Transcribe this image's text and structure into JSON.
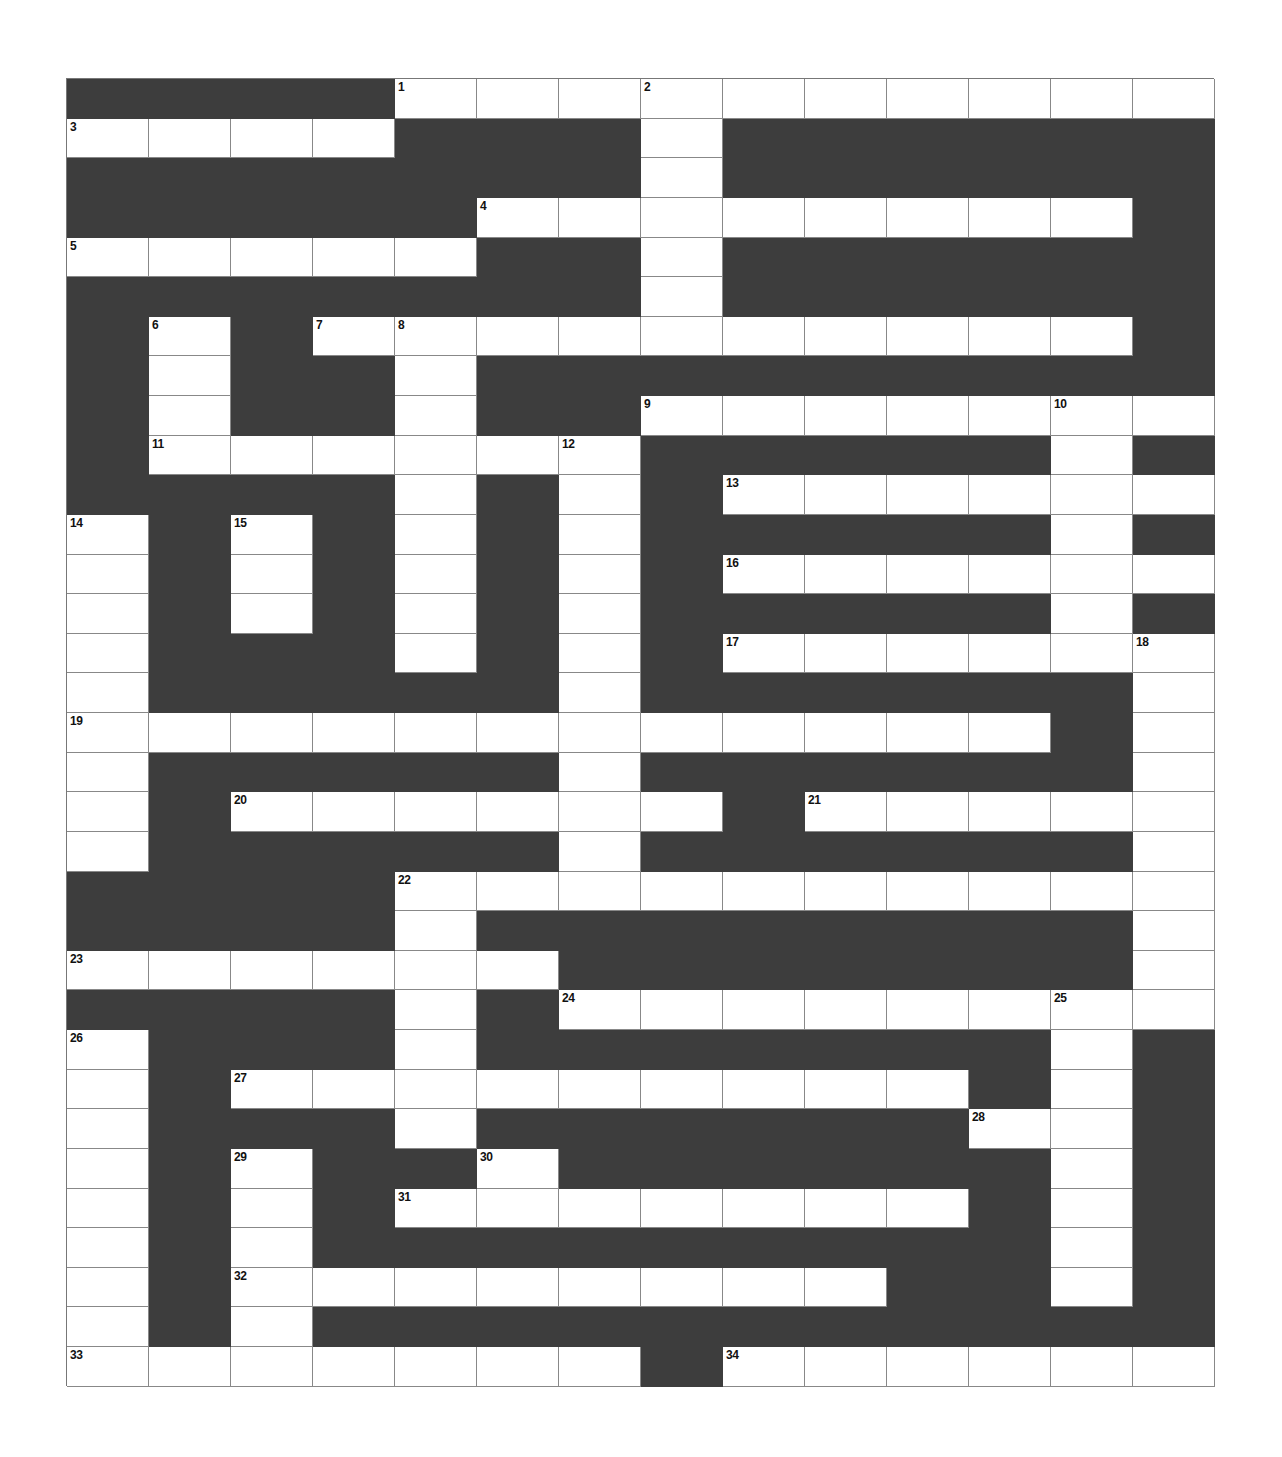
{
  "puzzle": {
    "type": "crossword",
    "columns": 14,
    "rows": 33,
    "colors": {
      "block": "#3d3d3d",
      "cell": "#ffffff",
      "line": "#888888"
    },
    "white_cells": [
      [
        4,
        5,
        6,
        7,
        8,
        9,
        10,
        11,
        12,
        13
      ],
      [
        0,
        1,
        2,
        3,
        7
      ],
      [
        7
      ],
      [
        5,
        6,
        7,
        8,
        9,
        10,
        11,
        12
      ],
      [
        0,
        1,
        2,
        3,
        4,
        7
      ],
      [
        7
      ],
      [
        1,
        3,
        4,
        5,
        6,
        7,
        8,
        9,
        10,
        11,
        12
      ],
      [
        1,
        4
      ],
      [
        1,
        4,
        7,
        8,
        9,
        10,
        11,
        12,
        13
      ],
      [
        1,
        2,
        3,
        4,
        5,
        6,
        12
      ],
      [
        4,
        6,
        8,
        9,
        10,
        11,
        12,
        13
      ],
      [
        0,
        2,
        4,
        6,
        12
      ],
      [
        0,
        2,
        4,
        6,
        8,
        9,
        10,
        11,
        12,
        13
      ],
      [
        0,
        2,
        4,
        6,
        12
      ],
      [
        0,
        4,
        6,
        8,
        9,
        10,
        11,
        12,
        13
      ],
      [
        0,
        6,
        13
      ],
      [
        0,
        1,
        2,
        3,
        4,
        5,
        6,
        7,
        8,
        9,
        10,
        11,
        13
      ],
      [
        0,
        6,
        13
      ],
      [
        0,
        2,
        3,
        4,
        5,
        6,
        7,
        9,
        10,
        11,
        12,
        13
      ],
      [
        0,
        6,
        13
      ],
      [
        4,
        5,
        6,
        7,
        8,
        9,
        10,
        11,
        12,
        13
      ],
      [
        4,
        13
      ],
      [
        0,
        1,
        2,
        3,
        4,
        5,
        13
      ],
      [
        4,
        6,
        7,
        8,
        9,
        10,
        11,
        12,
        13
      ],
      [
        0,
        4,
        12
      ],
      [
        0,
        2,
        3,
        4,
        5,
        6,
        7,
        8,
        9,
        10,
        12
      ],
      [
        0,
        4,
        11,
        12
      ],
      [
        0,
        2,
        5,
        12
      ],
      [
        0,
        2,
        4,
        5,
        6,
        7,
        8,
        9,
        10,
        12
      ],
      [
        0,
        2,
        12
      ],
      [
        0,
        2,
        3,
        4,
        5,
        6,
        7,
        8,
        9,
        12
      ],
      [
        0,
        2
      ],
      [
        0,
        1,
        2,
        3,
        4,
        5,
        6,
        8,
        9,
        10,
        11,
        12,
        13
      ]
    ],
    "numbers": [
      {
        "n": "1",
        "r": 0,
        "c": 4
      },
      {
        "n": "2",
        "r": 0,
        "c": 7
      },
      {
        "n": "3",
        "r": 1,
        "c": 0
      },
      {
        "n": "4",
        "r": 3,
        "c": 5
      },
      {
        "n": "5",
        "r": 4,
        "c": 0
      },
      {
        "n": "6",
        "r": 6,
        "c": 1
      },
      {
        "n": "7",
        "r": 6,
        "c": 3
      },
      {
        "n": "8",
        "r": 6,
        "c": 4
      },
      {
        "n": "9",
        "r": 8,
        "c": 7
      },
      {
        "n": "10",
        "r": 8,
        "c": 12
      },
      {
        "n": "11",
        "r": 9,
        "c": 1
      },
      {
        "n": "12",
        "r": 9,
        "c": 6
      },
      {
        "n": "13",
        "r": 10,
        "c": 8
      },
      {
        "n": "14",
        "r": 11,
        "c": 0
      },
      {
        "n": "15",
        "r": 11,
        "c": 2
      },
      {
        "n": "16",
        "r": 12,
        "c": 8
      },
      {
        "n": "17",
        "r": 14,
        "c": 8
      },
      {
        "n": "18",
        "r": 14,
        "c": 13
      },
      {
        "n": "19",
        "r": 16,
        "c": 0
      },
      {
        "n": "20",
        "r": 18,
        "c": 2
      },
      {
        "n": "21",
        "r": 18,
        "c": 9
      },
      {
        "n": "22",
        "r": 20,
        "c": 4
      },
      {
        "n": "23",
        "r": 22,
        "c": 0
      },
      {
        "n": "24",
        "r": 23,
        "c": 6
      },
      {
        "n": "25",
        "r": 23,
        "c": 12
      },
      {
        "n": "26",
        "r": 24,
        "c": 0
      },
      {
        "n": "27",
        "r": 25,
        "c": 2
      },
      {
        "n": "28",
        "r": 26,
        "c": 11
      },
      {
        "n": "29",
        "r": 27,
        "c": 2
      },
      {
        "n": "30",
        "r": 27,
        "c": 5
      },
      {
        "n": "31",
        "r": 28,
        "c": 4
      },
      {
        "n": "32",
        "r": 30,
        "c": 2
      },
      {
        "n": "33",
        "r": 32,
        "c": 0
      },
      {
        "n": "34",
        "r": 32,
        "c": 8
      }
    ]
  }
}
